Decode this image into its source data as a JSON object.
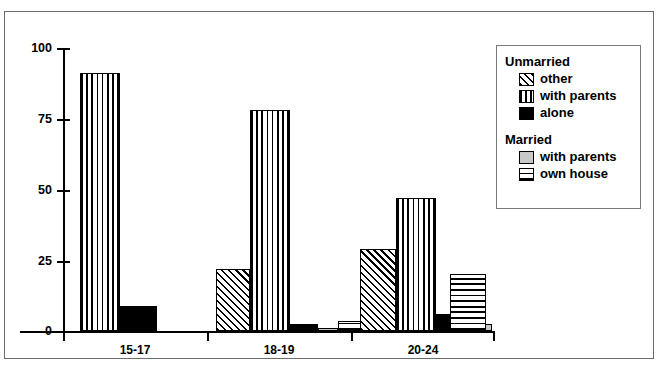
{
  "chart_data": {
    "type": "bar",
    "title": "",
    "subtitle": "",
    "xlabel": "",
    "ylabel": "",
    "ylim": [
      0,
      100
    ],
    "yticks": [
      "0",
      "25",
      "50",
      "75",
      "100"
    ],
    "ytick_values": [
      0,
      25,
      50,
      75,
      100
    ],
    "grid": false,
    "legend_position": "right",
    "categories": [
      "15-17",
      "18-19",
      "20-24"
    ],
    "series": [
      {
        "name": "other",
        "group": "Unmarried",
        "pattern": "diagonal-hatch",
        "values": [
          0,
          22,
          29
        ]
      },
      {
        "name": "with parents",
        "group": "Unmarried",
        "pattern": "vertical-lines",
        "values": [
          91,
          78,
          47
        ]
      },
      {
        "name": "alone",
        "group": "Unmarried",
        "pattern": "solid-black",
        "values": [
          9,
          2.5,
          6
        ]
      },
      {
        "name": "with parents",
        "group": "Married",
        "pattern": "solid-gray",
        "values": [
          0,
          1,
          2.5
        ]
      },
      {
        "name": "own house",
        "group": "Married",
        "pattern": "horizontal-lines",
        "values": [
          0,
          3.5,
          20
        ]
      }
    ]
  },
  "legend": {
    "sections": [
      {
        "title": "Unmarried",
        "items": [
          {
            "label": "other",
            "swatch": "diagonal-hatch"
          },
          {
            "label": "with parents",
            "swatch": "vertical-lines"
          },
          {
            "label": "alone",
            "swatch": "solid-black"
          }
        ]
      },
      {
        "title": "Married",
        "items": [
          {
            "label": "with parents",
            "swatch": "solid-gray"
          },
          {
            "label": "own house",
            "swatch": "horizontal-lines"
          }
        ]
      }
    ]
  },
  "colors": {
    "axis": "#000000",
    "frame": "#6b6b6b",
    "background": "#ffffff",
    "bar_outline": "#000000",
    "gray_fill": "#c8c8c8"
  },
  "axes": {
    "y_labels": [
      "100",
      "75",
      "50",
      "25",
      "0"
    ],
    "x_labels": [
      "15-17",
      "18-19",
      "20-24"
    ]
  }
}
